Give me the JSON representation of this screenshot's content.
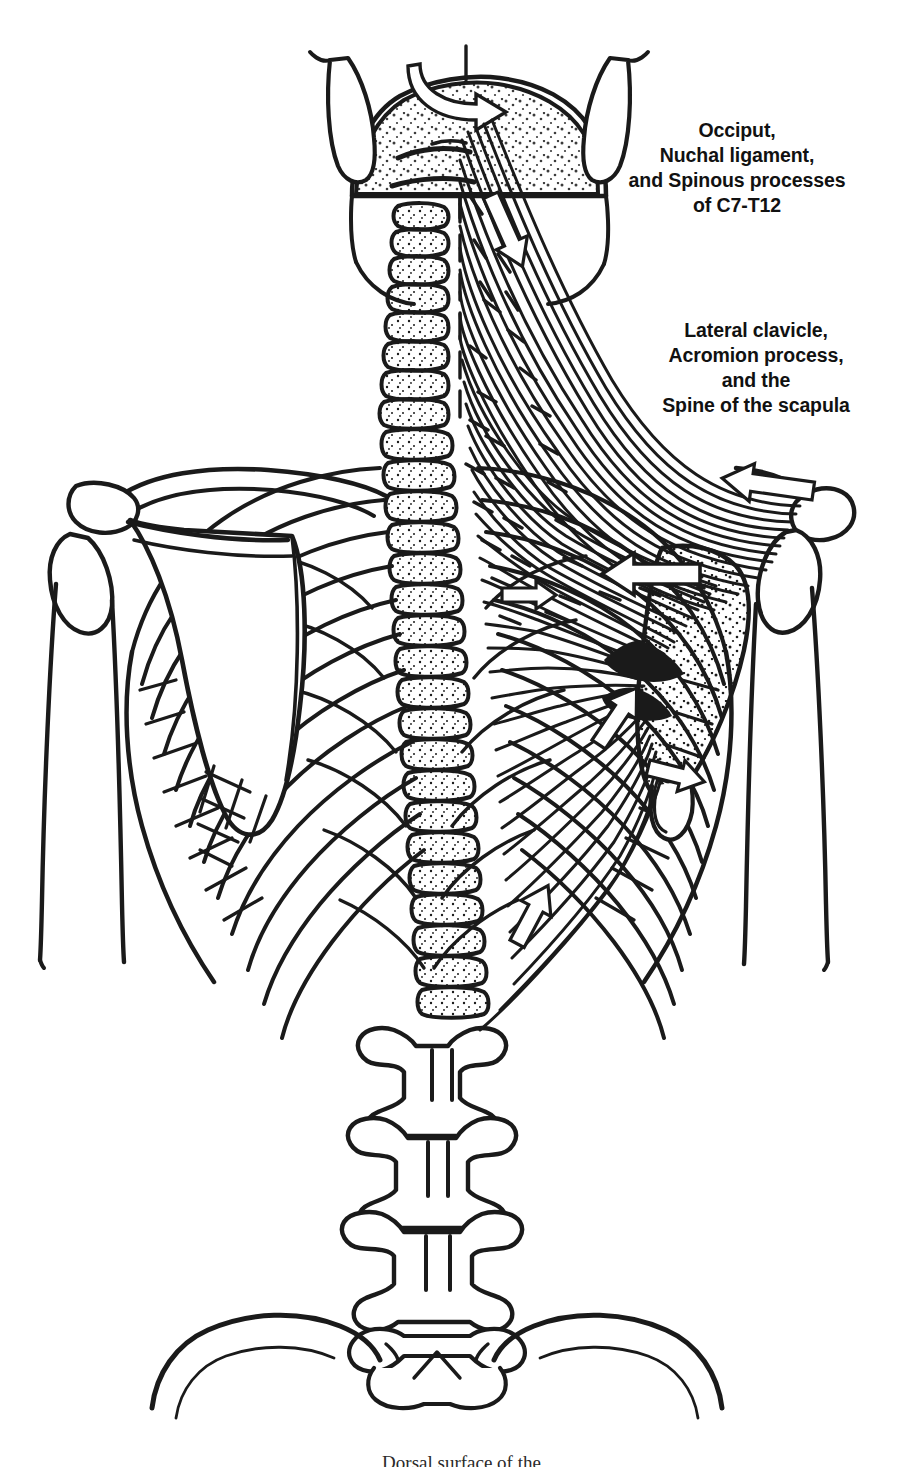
{
  "figure": {
    "style": "black and white line drawing",
    "background_color": "#ffffff",
    "ink_color": "#1a1a1a"
  },
  "labels": {
    "origin": {
      "text": "Occiput,\nNuchal ligament,\nand Spinous processes\nof C7-T12",
      "lines": [
        "Occiput,",
        "Nuchal ligament,",
        "and Spinous processes",
        "of C7-T12"
      ],
      "role": "origin-of-trapezius"
    },
    "insertion": {
      "text": "Lateral clavicle,\nAcromion process,\nand the\nSpine of the scapula",
      "lines": [
        "Lateral clavicle,",
        "Acromion process,",
        "and the",
        "Spine of the scapula"
      ],
      "role": "insertion-of-trapezius"
    }
  },
  "caption": {
    "text": "Dorsal surface of the",
    "note": "clipped at bottom edge of image"
  },
  "anatomy": {
    "structures": [
      "skull occiput",
      "mastoid processes",
      "cervical vertebrae C1-C7",
      "thoracic vertebrae T1-T12",
      "lumbar vertebrae L1-L5",
      "sacrum",
      "iliac crests",
      "rib cage",
      "left scapula",
      "right scapula",
      "clavicles",
      "humerus left",
      "humerus right",
      "trapezius muscle fibers",
      "nuchal ligament"
    ],
    "arrow_count": 6,
    "arrows": [
      {
        "name": "rotation-arrow-occiput",
        "direction": "curved-right"
      },
      {
        "name": "fiber-arrow-upper",
        "direction": "down-right"
      },
      {
        "name": "fiber-arrow-acromion",
        "direction": "left"
      },
      {
        "name": "fiber-arrow-middle-large",
        "direction": "left"
      },
      {
        "name": "fiber-arrow-middle-small",
        "direction": "right"
      },
      {
        "name": "fiber-arrow-lower",
        "direction": "up-right"
      },
      {
        "name": "fiber-arrow-scapula-inferior",
        "direction": "right"
      }
    ]
  }
}
